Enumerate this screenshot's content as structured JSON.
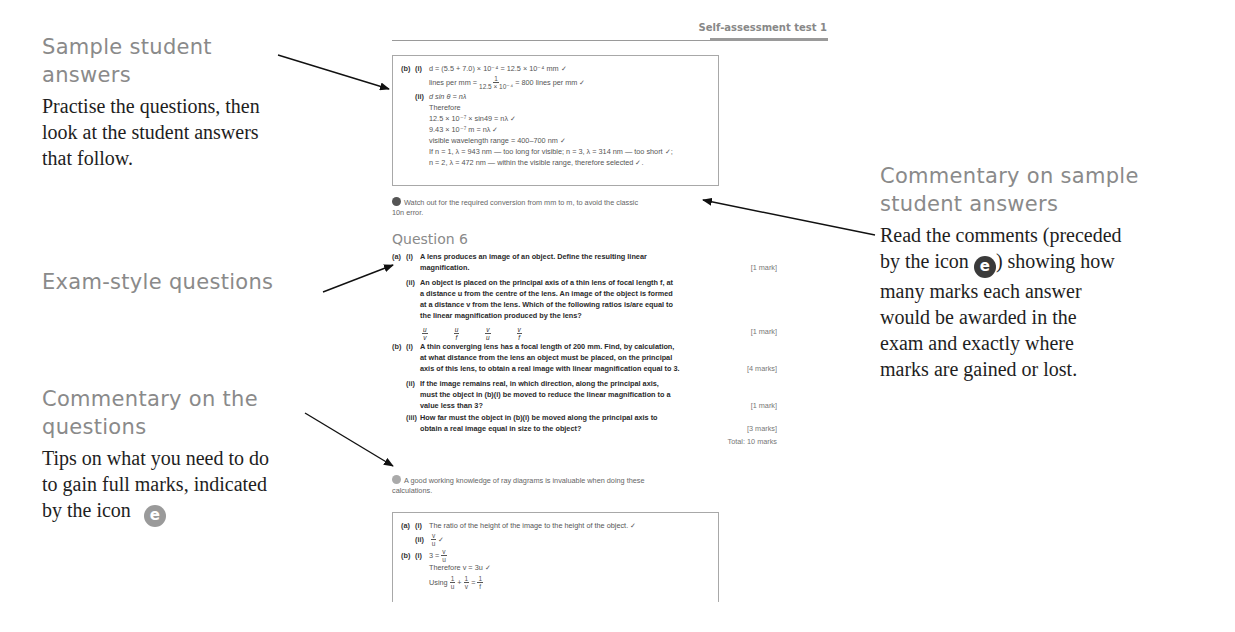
{
  "callouts": {
    "sample_answers": {
      "heading": "Sample student answers",
      "heading_lines": [
        "Sample student",
        "answers"
      ],
      "body_lines": [
        "Practise the questions, then",
        "look at the student answers",
        "that follow."
      ]
    },
    "exam_questions": {
      "heading": "Exam-style questions"
    },
    "commentary_questions": {
      "heading_lines": [
        "Commentary on the",
        "questions"
      ],
      "body_lines": [
        "Tips on what you need to do",
        "to gain full marks, indicated",
        "by the icon"
      ],
      "icon": "e-icon-light"
    },
    "commentary_answers": {
      "heading_lines": [
        "Commentary on sample",
        "student answers"
      ],
      "body_line1": "Read the comments (preceded",
      "body_line2_pre": "by the icon",
      "body_line2_post": ") showing how",
      "body_lines_rest": [
        "many marks each answer",
        "would be awarded in the",
        "exam and exactly where",
        "marks are gained or lost."
      ],
      "icon": "e-icon-dark"
    }
  },
  "page": {
    "running_head": "Self-assessment test 1",
    "answer_box_1": {
      "b_label": "(b)",
      "i_label": "(i)",
      "line1": "d = (5.5 + 7.0) × 10⁻⁴ = 12.5 × 10⁻⁴ mm ✓",
      "line2_pre": "lines per mm =",
      "line2_num": "1",
      "line2_den": "12.5 × 10⁻⁴",
      "line2_post": "= 800 lines per mm ✓",
      "ii_label": "(ii)",
      "line3": "d sin θ = nλ",
      "line4": "Therefore",
      "line5": "12.5 × 10⁻⁷ × sin49 = nλ  ✓",
      "line6": "9.43 × 10⁻⁷ m = nλ ✓",
      "line7": "visible wavelength range = 400–700 nm ✓",
      "line8": "If n = 1, λ = 943 nm — too long for visible; n = 3, λ = 314 nm — too short ✓;",
      "line9": "n = 2, λ = 472 nm — within the visible range, therefore selected ✓."
    },
    "comment_1": {
      "line1": "Watch out for the required conversion from mm to m, to avoid the classic",
      "line2": "10n error."
    },
    "question_title": "Question 6",
    "question_6": {
      "a_label": "(a)",
      "a_i_label": "(i)",
      "a_i_text1": "A lens produces an image of an object. Define the resulting",
      "a_i_bold": "linear",
      "a_i_text2": "magnification.",
      "a_i_marks": "[1 mark]",
      "a_ii_label": "(ii)",
      "a_ii_lines": [
        "An object is placed on the principal axis of a thin lens of focal length f, at",
        "a distance u from the centre of the lens. An image of the object is formed",
        "at a distance v from the lens. Which of the following ratios is/are equal to",
        "the linear magnification produced by the lens?"
      ],
      "ratios": [
        {
          "num": "u",
          "den": "v"
        },
        {
          "num": "u",
          "den": "f"
        },
        {
          "num": "v",
          "den": "u"
        },
        {
          "num": "v",
          "den": "f"
        }
      ],
      "a_ii_marks": "[1 mark]",
      "b_label": "(b)",
      "b_i_label": "(i)",
      "b_i_lines": [
        "A thin converging lens has a focal length of 200 mm. Find, by calculation,",
        "at what distance from the lens an object must be placed, on the principal",
        "axis of this lens, to obtain a real image with linear magnification equal to 3."
      ],
      "b_i_marks": "[4 marks]",
      "b_ii_label": "(ii)",
      "b_ii_lines": [
        "If the image remains real, in which direction, along the principal axis,",
        "must the object in (b)(i) be moved to reduce the linear magnification to a",
        "value less than 3?"
      ],
      "b_ii_marks": "[1 mark]",
      "b_iii_label": "(iii)",
      "b_iii_lines": [
        "How far must the object in (b)(i) be moved along the principal axis to",
        "obtain a real image equal in size to the object?"
      ],
      "b_iii_marks": "[3 marks]",
      "total": "Total: 10 marks"
    },
    "comment_2": {
      "line1": "A good working knowledge of ray diagrams is invaluable when doing these",
      "line2": "calculations."
    },
    "answer_box_2": {
      "a_label": "(a)",
      "i_label": "(i)",
      "line1": "The ratio of the height of the image to the height of the object. ✓",
      "ii_label": "(ii)",
      "line2_num": "v",
      "line2_den": "u",
      "line2_post": "✓",
      "b_label": "(b)",
      "b_i_label": "(i)",
      "line3_pre": "3 =",
      "line3_num": "v",
      "line3_den": "u",
      "line4": "Therefore v = 3u ✓",
      "line5_pre": "Using",
      "line5_f1_num": "1",
      "line5_f1_den": "u",
      "line5_plus": "+",
      "line5_f2_num": "1",
      "line5_f2_den": "v",
      "line5_eq": "=",
      "line5_f3_num": "1",
      "line5_f3_den": "f"
    }
  },
  "icons": {
    "e_glyph": "e"
  },
  "colors": {
    "heading_gray": "#8a8a8a",
    "body_black": "#1e1e1e",
    "icon_dark": "#3a3a3a",
    "icon_light": "#9a9a9a"
  }
}
